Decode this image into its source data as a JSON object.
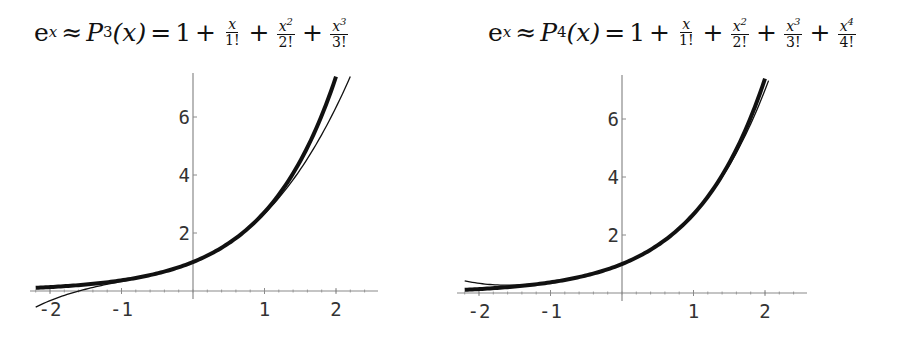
{
  "panels": [
    {
      "title": {
        "lhs": "e",
        "lhs_exp": "x",
        "approx": "≈",
        "poly": "P",
        "poly_sub": "3",
        "arg": "(x)",
        "eq": "=",
        "const": "1",
        "terms": [
          {
            "num": "x",
            "num_exp": "",
            "den": "1!"
          },
          {
            "num": "x",
            "num_exp": "2",
            "den": "2!"
          },
          {
            "num": "x",
            "num_exp": "3",
            "den": "3!"
          }
        ]
      }
    },
    {
      "title": {
        "lhs": "e",
        "lhs_exp": "x",
        "approx": "≈",
        "poly": "P",
        "poly_sub": "4",
        "arg": "(x)",
        "eq": "=",
        "const": "1",
        "terms": [
          {
            "num": "x",
            "num_exp": "",
            "den": "1!"
          },
          {
            "num": "x",
            "num_exp": "2",
            "den": "2!"
          },
          {
            "num": "x",
            "num_exp": "3",
            "den": "3!"
          },
          {
            "num": "x",
            "num_exp": "4",
            "den": "4!"
          }
        ]
      }
    }
  ],
  "chart_data": [
    {
      "type": "line",
      "title": "e^x ≈ P_3(x) = 1 + x/1! + x^2/2! + x^3/3!",
      "xlabel": "",
      "ylabel": "",
      "xlim": [
        -2.3,
        2.6
      ],
      "ylim": [
        0,
        7.5
      ],
      "x_ticks": [
        -2,
        -1,
        1,
        2
      ],
      "x_tick_labels": [
        "-2",
        "-1",
        "1",
        "2"
      ],
      "y_ticks": [
        2,
        4,
        6
      ],
      "y_tick_labels": [
        "2",
        "4",
        "6"
      ],
      "grid": false,
      "legend": null,
      "x": [
        -2.2,
        -2.0,
        -1.5,
        -1.0,
        -0.5,
        0.0,
        0.5,
        1.0,
        1.5,
        2.0,
        2.2
      ],
      "series": [
        {
          "name": "e^x",
          "style": "thick",
          "values": [
            0.11,
            0.14,
            0.22,
            0.37,
            0.61,
            1.0,
            1.65,
            2.72,
            4.48,
            7.39,
            null
          ]
        },
        {
          "name": "P_3(x)",
          "style": "thin",
          "values": [
            -0.39,
            -0.33,
            0.06,
            0.33,
            0.6,
            1.0,
            1.65,
            2.67,
            4.19,
            6.33,
            7.39
          ]
        }
      ],
      "coeffs": [
        1,
        1,
        0.5,
        0.16667
      ],
      "exp_range": [
        -2.2,
        2.0
      ],
      "poly_range": [
        -2.2,
        2.2
      ]
    },
    {
      "type": "line",
      "title": "e^x ≈ P_4(x) = 1 + x/1! + x^2/2! + x^3/3! + x^4/4!",
      "xlabel": "",
      "ylabel": "",
      "xlim": [
        -2.3,
        2.6
      ],
      "ylim": [
        0,
        7.5
      ],
      "x_ticks": [
        -2,
        -1,
        1,
        2
      ],
      "x_tick_labels": [
        "-2",
        "-1",
        "1",
        "2"
      ],
      "y_ticks": [
        2,
        4,
        6
      ],
      "y_tick_labels": [
        "2",
        "4",
        "6"
      ],
      "grid": false,
      "legend": null,
      "x": [
        -2.2,
        -2.0,
        -1.5,
        -1.0,
        -0.5,
        0.0,
        0.5,
        1.0,
        1.5,
        2.0,
        2.05
      ],
      "series": [
        {
          "name": "e^x",
          "style": "thick",
          "values": [
            0.11,
            0.14,
            0.22,
            0.37,
            0.61,
            1.0,
            1.65,
            2.72,
            4.48,
            7.39,
            null
          ]
        },
        {
          "name": "P_4(x)",
          "style": "thin",
          "values": [
            0.5,
            0.33,
            0.27,
            0.38,
            0.6,
            1.0,
            1.65,
            2.71,
            4.4,
            7.0,
            7.4
          ]
        }
      ],
      "coeffs": [
        1,
        1,
        0.5,
        0.16667,
        0.041667
      ],
      "exp_range": [
        -2.2,
        2.0
      ],
      "poly_range": [
        -2.2,
        2.05
      ]
    }
  ],
  "layout": {
    "panels_px": [
      {
        "origin_x": 193,
        "origin_y": 291,
        "unit_x": 71.5,
        "unit_y": 29,
        "x_axis_from": 30,
        "x_axis_to": 378,
        "y_axis_top": 73,
        "title_left": 34
      },
      {
        "origin_x": 622,
        "origin_y": 293,
        "unit_x": 71.5,
        "unit_y": 29,
        "x_axis_from": 457,
        "x_axis_to": 807,
        "y_axis_top": 75,
        "title_left": 488
      }
    ],
    "colors": {
      "axis": "#8a8a8a",
      "curve": "#111111",
      "text": "#333333"
    }
  }
}
